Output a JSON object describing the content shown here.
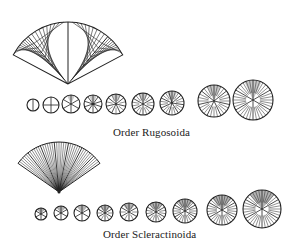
{
  "figure": {
    "ink_color": "#222222",
    "background": "#ffffff"
  },
  "orders": [
    {
      "label": "Order Rugosoida",
      "septal_pattern": "pinnate (serial insertion in four quadrants)",
      "fan": {
        "apex_x": 68,
        "apex_y": 84,
        "radius": 62,
        "start_deg": 208,
        "end_deg": 332,
        "major_septa_deg": [
          230,
          270,
          310
        ]
      },
      "growth_stages": [
        {
          "cx": 33,
          "cy": 105,
          "r": 6,
          "septa": 2
        },
        {
          "cx": 51,
          "cy": 105,
          "r": 8,
          "septa": 4
        },
        {
          "cx": 71,
          "cy": 104,
          "r": 9,
          "septa": 6
        },
        {
          "cx": 93,
          "cy": 104,
          "r": 9,
          "septa": 10
        },
        {
          "cx": 116,
          "cy": 104,
          "r": 10,
          "septa": 14
        },
        {
          "cx": 143,
          "cy": 104,
          "r": 11,
          "septa": 18
        },
        {
          "cx": 172,
          "cy": 103,
          "r": 12,
          "septa": 22
        },
        {
          "cx": 214,
          "cy": 101,
          "r": 16,
          "septa": 28
        },
        {
          "cx": 253,
          "cy": 100,
          "r": 20,
          "septa": 36
        }
      ]
    },
    {
      "label": "Order Scleractinoida",
      "septal_pattern": "cyclic (hexameral insertion)",
      "fan": {
        "apex_x": 59,
        "apex_y": 192,
        "radius": 50,
        "start_deg": 215,
        "end_deg": 325,
        "rays": 40
      },
      "growth_stages": [
        {
          "cx": 41,
          "cy": 214,
          "r": 6,
          "septa": 6
        },
        {
          "cx": 61,
          "cy": 213,
          "r": 7,
          "septa": 6
        },
        {
          "cx": 82,
          "cy": 213,
          "r": 8,
          "septa": 6
        },
        {
          "cx": 105,
          "cy": 213,
          "r": 8,
          "septa": 12
        },
        {
          "cx": 129,
          "cy": 212,
          "r": 9,
          "septa": 12
        },
        {
          "cx": 156,
          "cy": 212,
          "r": 10,
          "septa": 18
        },
        {
          "cx": 185,
          "cy": 211,
          "r": 12,
          "septa": 24
        },
        {
          "cx": 222,
          "cy": 210,
          "r": 15,
          "septa": 30
        },
        {
          "cx": 262,
          "cy": 209,
          "r": 19,
          "septa": 36
        }
      ]
    }
  ]
}
